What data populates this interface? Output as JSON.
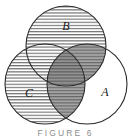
{
  "figure": {
    "type": "venn-diagram-3-set",
    "caption": "FIGURE 6",
    "background_color": "#ffffff",
    "stroke_color": "#2b2b2b",
    "hatch_color": "#6e6e6e",
    "shade_color": "#9a9a9a",
    "shade_dark_color": "#8a8a8a",
    "sets": [
      {
        "id": "B",
        "label": "B",
        "cx": 66,
        "cy": 46,
        "r": 40,
        "fill": "hatched",
        "label_x": 66,
        "label_y": 26
      },
      {
        "id": "C",
        "label": "C",
        "cx": 45,
        "cy": 84,
        "r": 40,
        "fill": "hatched",
        "label_x": 29,
        "label_y": 93
      },
      {
        "id": "A",
        "label": "A",
        "cx": 87,
        "cy": 84,
        "r": 40,
        "fill": "none",
        "label_x": 105,
        "label_y": 92
      }
    ],
    "shaded_regions": [
      {
        "id": "A-and-B",
        "description": "A intersect B, shaded gray with hatching"
      },
      {
        "id": "A-and-C",
        "description": "A intersect C, shaded gray with hatching"
      },
      {
        "id": "A-and-B-and-C",
        "description": "A intersect B intersect C, shaded darker gray with hatching"
      }
    ]
  }
}
